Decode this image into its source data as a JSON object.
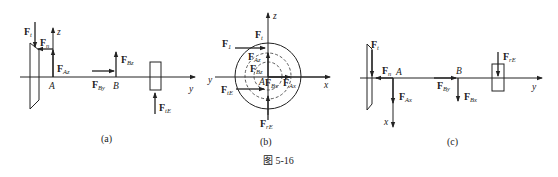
{
  "figure_caption": "图 5-16",
  "panels": {
    "a": {
      "caption": "(a)",
      "axes": {
        "y": "y",
        "z": "z"
      },
      "points": {
        "A": "A",
        "B": "B"
      },
      "forces": {
        "Ft": {
          "main": "F",
          "sub": "t"
        },
        "Fn": {
          "main": "F",
          "sub": "n"
        },
        "FAz": {
          "main": "F",
          "sub": "Az"
        },
        "FBz": {
          "main": "F",
          "sub": "Bz"
        },
        "FBy": {
          "main": "F",
          "sub": "By"
        },
        "FtE": {
          "main": "F",
          "sub": "tE"
        }
      }
    },
    "b": {
      "caption": "(b)",
      "axes": {
        "x": "x",
        "z": "z",
        "y": "y"
      },
      "points": {
        "A": "A"
      },
      "forces": {
        "Ft": {
          "main": "F",
          "sub": "t"
        },
        "F1": {
          "main": "F",
          "sub": "1"
        },
        "FAz": {
          "main": "F",
          "sub": "Az"
        },
        "FBz": {
          "main": "F",
          "sub": "Bz"
        },
        "FBx": {
          "main": "F",
          "sub": "Bx"
        },
        "FAx": {
          "main": "F",
          "sub": "Ax"
        },
        "FtE": {
          "main": "F",
          "sub": "tE"
        },
        "FrE": {
          "main": "F",
          "sub": "rE"
        }
      }
    },
    "c": {
      "caption": "(c)",
      "axes": {
        "x": "x",
        "y": "y"
      },
      "points": {
        "A": "A",
        "B": "B"
      },
      "forces": {
        "Ft": {
          "main": "F",
          "sub": "t"
        },
        "Fn": {
          "main": "F",
          "sub": "n"
        },
        "FAx": {
          "main": "F",
          "sub": "Ax"
        },
        "FBy": {
          "main": "F",
          "sub": "By"
        },
        "FBx": {
          "main": "F",
          "sub": "Bx"
        },
        "FrE": {
          "main": "F",
          "sub": "rE"
        }
      }
    }
  },
  "colors": {
    "ink": "#222222",
    "background": "#ffffff"
  }
}
